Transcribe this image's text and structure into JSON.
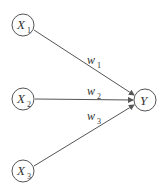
{
  "diagram": {
    "title": "",
    "inputs": [
      {
        "id": "x1",
        "label": "X",
        "sub": "1"
      },
      {
        "id": "x2",
        "label": "X",
        "sub": "2"
      },
      {
        "id": "x3",
        "label": "X",
        "sub": "3"
      }
    ],
    "output": {
      "id": "y",
      "label": "Y"
    },
    "edges": [
      {
        "from": "x1",
        "to": "y",
        "label": "w",
        "sub": "1"
      },
      {
        "from": "x2",
        "to": "y",
        "label": "w",
        "sub": "2"
      },
      {
        "from": "x3",
        "to": "y",
        "label": "w",
        "sub": "3"
      }
    ],
    "colors": {
      "stroke": "#555555",
      "text": "#333333",
      "background": "#ffffff"
    }
  }
}
